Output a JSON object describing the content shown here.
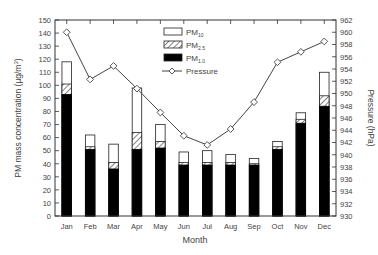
{
  "chart_data": {
    "type": "bar",
    "subtype": "stacked bar with line on secondary axis",
    "title": "",
    "xlabel": "Month",
    "ylabel": "PM mass concentration (µg/m³)",
    "y2label": "Pressure (hPa)",
    "categories": [
      "Jan",
      "Feb",
      "Mar",
      "Apr",
      "May",
      "Jun",
      "Jul",
      "Aug",
      "Sep",
      "Oct",
      "Nov",
      "Dec"
    ],
    "ylim": [
      0,
      150
    ],
    "yticks": [
      0,
      10,
      20,
      30,
      40,
      50,
      60,
      70,
      80,
      90,
      100,
      110,
      120,
      130,
      140,
      150
    ],
    "y2lim": [
      930,
      962
    ],
    "y2ticks": [
      930,
      932,
      934,
      936,
      938,
      940,
      942,
      944,
      946,
      948,
      950,
      952,
      954,
      956,
      958,
      960,
      962
    ],
    "series": [
      {
        "name": "PM10",
        "axis": "left",
        "style": "white",
        "values": [
          118,
          62,
          55,
          98,
          70,
          49,
          50,
          47,
          44,
          57,
          79,
          110
        ]
      },
      {
        "name": "PM2.5",
        "axis": "left",
        "style": "hatched",
        "values": [
          101,
          53,
          41,
          64,
          57,
          41,
          41,
          41,
          40,
          53,
          74,
          92
        ]
      },
      {
        "name": "PM1.0",
        "axis": "left",
        "style": "black",
        "values": [
          93,
          51,
          36,
          51,
          52,
          39,
          39,
          39,
          39,
          51,
          71,
          84
        ]
      },
      {
        "name": "Pressure",
        "axis": "right",
        "style": "line-diamond",
        "values": [
          960.0,
          952.3,
          954.5,
          950.8,
          946.9,
          943.1,
          941.6,
          944.2,
          948.6,
          955.1,
          956.8,
          958.5
        ]
      }
    ],
    "legend": {
      "position": "top-center-inside",
      "entries": [
        {
          "label": "PM",
          "sub": "10",
          "swatch": "white"
        },
        {
          "label": "PM",
          "sub": "2.5",
          "swatch": "hatched"
        },
        {
          "label": "PM",
          "sub": "1.0",
          "swatch": "black"
        },
        {
          "label": "Pressure",
          "swatch": "line-diamond"
        }
      ]
    },
    "grid": false
  }
}
